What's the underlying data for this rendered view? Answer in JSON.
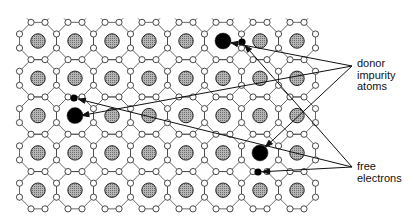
{
  "diagram": {
    "lattice": {
      "columns": 8,
      "rows": 5,
      "origin_x": 38,
      "origin_y": 41,
      "pitch_x": 37,
      "pitch_y": 37.3,
      "host_atom_fill": "#a8a8a8",
      "impurity_fill": "#000000"
    },
    "impurities": [
      {
        "col": 5,
        "row": 0,
        "x": 222,
        "y": 41
      },
      {
        "col": 1,
        "row": 2,
        "x": 73,
        "y": 117
      },
      {
        "col": 6,
        "row": 3,
        "x": 259,
        "y": 153
      }
    ],
    "free_electrons": [
      {
        "x": 242,
        "y": 42
      },
      {
        "x": 74,
        "y": 98
      },
      {
        "x": 258,
        "y": 172
      }
    ],
    "labels": {
      "donor": [
        "donor",
        "impurity",
        "atoms"
      ],
      "free": [
        "free",
        "electrons"
      ]
    },
    "pointers": {
      "donor_origin": [
        352,
        66
      ],
      "free_origin": [
        352,
        167
      ]
    }
  }
}
